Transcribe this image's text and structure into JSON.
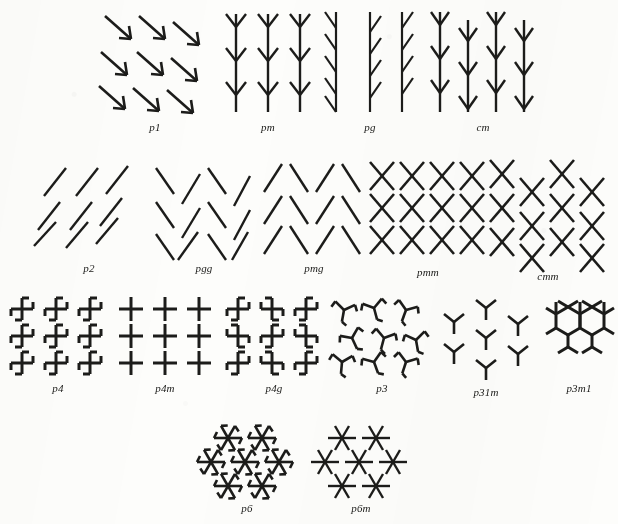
{
  "figure": {
    "caption": "",
    "background_color": "#fdfdfb",
    "ink_color": "#1c1c1a",
    "rows": [
      {
        "row_index": 1,
        "panels": [
          {
            "label": "p1",
            "motif": "down-right-arrow",
            "lattice": "oblique-sheared",
            "cols": 3,
            "rows": 3
          },
          {
            "label": "pm",
            "motif": "stem-with-double-chevron",
            "lattice": "rectangular",
            "cols": 3,
            "rows": 3
          },
          {
            "label": "pg",
            "motif": "stem-with-alternating-branch",
            "lattice": "rectangular-glide",
            "cols": 3,
            "rows": 3
          },
          {
            "label": "cm",
            "motif": "stem-with-double-chevron",
            "lattice": "centred-rectangular",
            "cols": 4,
            "rows": 3
          }
        ]
      },
      {
        "row_index": 2,
        "panels": [
          {
            "label": "p2",
            "motif": "slash-stroke",
            "lattice": "oblique-sheared",
            "cols": 3,
            "rows": 3
          },
          {
            "label": "pgg",
            "motif": "alternating-slash-backslash",
            "lattice": "rectangular-glide",
            "cols": 3,
            "rows": 3
          },
          {
            "label": "pmg",
            "motif": "open-chevron-pair",
            "lattice": "rectangular",
            "cols": 2,
            "rows": 3
          },
          {
            "label": "pmm",
            "motif": "x-cross",
            "lattice": "rectangular",
            "cols": 4,
            "rows": 3
          },
          {
            "label": "cmm",
            "motif": "x-cross",
            "lattice": "centred-rectangular",
            "cols": 4,
            "rows": 3
          }
        ]
      },
      {
        "row_index": 3,
        "panels": [
          {
            "label": "p4",
            "motif": "pinwheel-cross",
            "lattice": "square",
            "cols": 3,
            "rows": 3
          },
          {
            "label": "p4m",
            "motif": "plain-cross",
            "lattice": "square",
            "cols": 3,
            "rows": 3
          },
          {
            "label": "p4g",
            "motif": "pinwheel-cross-alternating",
            "lattice": "square",
            "cols": 3,
            "rows": 3
          },
          {
            "label": "p3",
            "motif": "hooked-tripod",
            "lattice": "hexagonal",
            "cols": 3,
            "rows": 3
          },
          {
            "label": "p31m",
            "motif": "plain-tripod",
            "lattice": "hexagonal",
            "cols": 3,
            "rows": 3
          },
          {
            "label": "p3m1",
            "motif": "tripod-honeycomb",
            "lattice": "hexagonal",
            "cols": 3,
            "rows": 3
          }
        ]
      },
      {
        "row_index": 4,
        "panels": [
          {
            "label": "p6",
            "motif": "six-arm-pinwheel",
            "lattice": "hexagonal",
            "cols": 3,
            "rows": 3
          },
          {
            "label": "p6m",
            "motif": "six-arm-star",
            "lattice": "hexagonal",
            "cols": 3,
            "rows": 3
          }
        ]
      }
    ]
  }
}
